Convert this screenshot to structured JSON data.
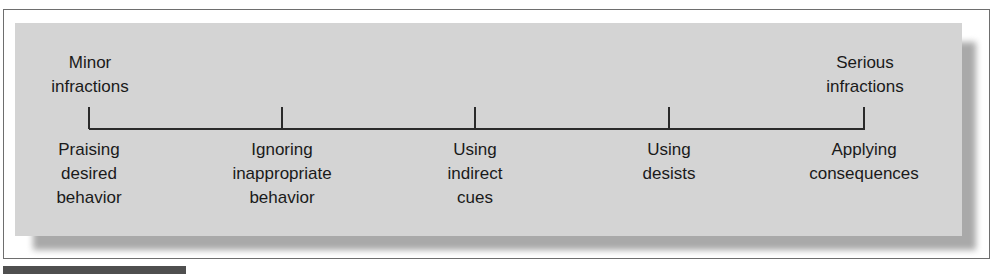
{
  "diagram": {
    "type": "continuum",
    "ends": {
      "left": "Minor\ninfractions",
      "right": "Serious\ninfractions"
    },
    "points": [
      {
        "label": "Praising\ndesired\nbehavior"
      },
      {
        "label": "Ignoring\ninappropriate\nbehavior"
      },
      {
        "label": "Using\nindirect\ncues"
      },
      {
        "label": "Using\ndesists"
      },
      {
        "label": "Applying\nconsequences"
      }
    ]
  },
  "colors": {
    "panel": "#d4d4d4",
    "line": "#2a2a2a",
    "frame_border": "#6e6e6e"
  }
}
